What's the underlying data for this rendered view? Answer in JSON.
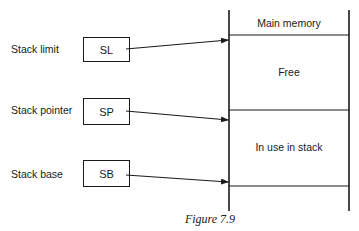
{
  "diagram": {
    "registers": [
      {
        "label": "Stack limit",
        "abbr": "SL"
      },
      {
        "label": "Stack pointer",
        "abbr": "SP"
      },
      {
        "label": "Stack base",
        "abbr": "SB"
      }
    ],
    "memory": {
      "title": "Main memory",
      "regions": [
        {
          "label": "Free"
        },
        {
          "label": "In use in stack"
        }
      ]
    },
    "arrows": [
      {
        "from": "SL",
        "to": "top of Free region"
      },
      {
        "from": "SP",
        "to": "top of In use in stack region"
      },
      {
        "from": "SB",
        "to": "bottom of In use in stack region"
      }
    ],
    "caption": "Figure 7.9"
  }
}
